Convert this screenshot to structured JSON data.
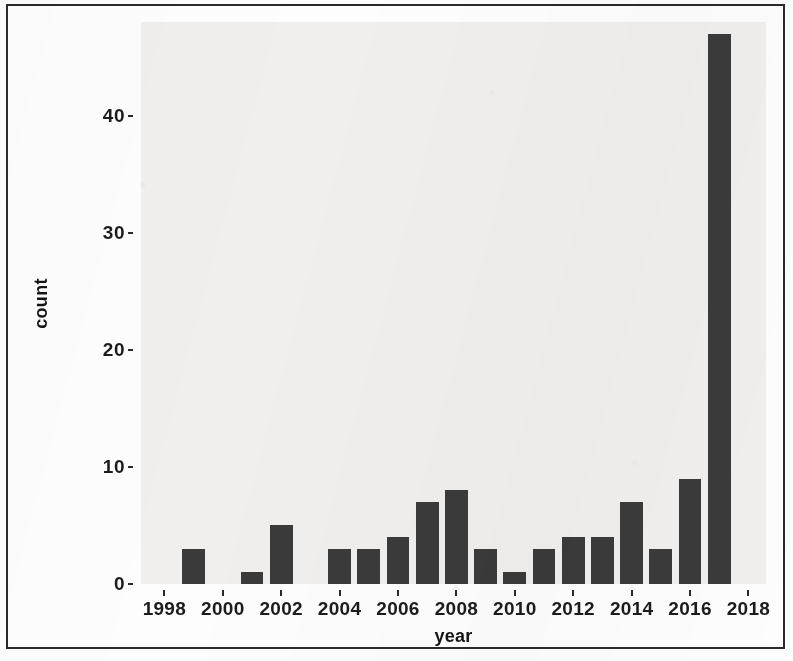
{
  "chart_data": {
    "type": "bar",
    "title": "",
    "xlabel": "year",
    "ylabel": "count",
    "xlim": [
      1997.2,
      2018.6
    ],
    "ylim": [
      0,
      48
    ],
    "grid": false,
    "legend": "none",
    "bar_color": "#3a3a3a",
    "panel_color": "#f0efee",
    "x_tick_labels": [
      "1998",
      "2000",
      "2002",
      "2004",
      "2006",
      "2008",
      "2010",
      "2012",
      "2014",
      "2016",
      "2018"
    ],
    "x_tick_values": [
      1998,
      2000,
      2002,
      2004,
      2006,
      2008,
      2010,
      2012,
      2014,
      2016,
      2018
    ],
    "y_tick_labels": [
      "0",
      "10",
      "20",
      "30",
      "40"
    ],
    "y_tick_values": [
      0,
      10,
      20,
      30,
      40
    ],
    "categories": [
      1999,
      2001,
      2002,
      2004,
      2005,
      2006,
      2007,
      2008,
      2009,
      2010,
      2011,
      2012,
      2013,
      2014,
      2015,
      2016,
      2017
    ],
    "values": [
      3,
      1,
      5,
      3,
      3,
      4,
      7,
      8,
      3,
      1,
      3,
      4,
      4,
      7,
      3,
      9,
      47
    ]
  }
}
